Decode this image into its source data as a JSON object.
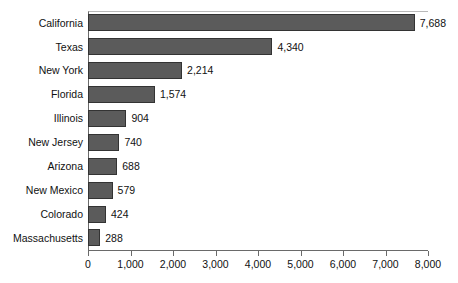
{
  "chart_data": {
    "type": "bar",
    "orientation": "horizontal",
    "title": "",
    "subtitle": "",
    "xlabel": "",
    "ylabel": "",
    "xlim": [
      0,
      8000
    ],
    "grid": false,
    "legend": false,
    "bar_color": "#5b5b5b",
    "bar_edge_color": "#333333",
    "background_color": "#ffffff",
    "categories": [
      "California",
      "Texas",
      "New York",
      "Florida",
      "Illinois",
      "New Jersey",
      "Arizona",
      "New Mexico",
      "Colorado",
      "Massachusetts"
    ],
    "values": [
      7688,
      4340,
      2214,
      1574,
      904,
      740,
      688,
      579,
      424,
      288
    ],
    "value_labels": [
      "7,688",
      "4,340",
      "2,214",
      "1,574",
      "904",
      "740",
      "688",
      "579",
      "424",
      "288"
    ],
    "xticks": [
      0,
      1000,
      2000,
      3000,
      4000,
      5000,
      6000,
      7000,
      8000
    ],
    "xtick_labels": [
      "0",
      "1,000",
      "2,000",
      "3,000",
      "4,000",
      "5,000",
      "6,000",
      "7,000",
      "8,000"
    ]
  }
}
